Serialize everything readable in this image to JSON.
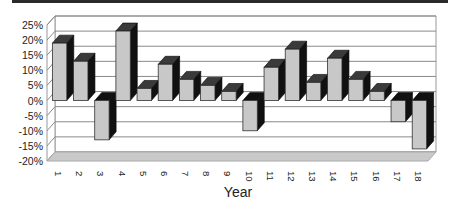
{
  "chart_data": {
    "type": "bar",
    "style": "3d-column",
    "title": "",
    "xlabel": "Year",
    "ylabel": "",
    "categories": [
      "1",
      "2",
      "3",
      "4",
      "5",
      "6",
      "7",
      "8",
      "9",
      "10",
      "11",
      "12",
      "13",
      "14",
      "15",
      "16",
      "17",
      "18"
    ],
    "values": [
      19,
      13,
      -13,
      23,
      4,
      12,
      7,
      5,
      3,
      -10,
      11,
      17,
      6,
      14,
      7,
      3,
      -7,
      -16
    ],
    "value_format": "percent",
    "y_ticks": [
      "25%",
      "20%",
      "15%",
      "10%",
      "5%",
      "0%",
      "-5%",
      "-10%",
      "-15%",
      "-20%"
    ],
    "ylim": [
      -20,
      25
    ],
    "grid": true,
    "legend": "none",
    "colors": {
      "bar_front": "#c8c8c8",
      "bar_top": "#3a3a3a",
      "bar_side": "#111111",
      "floor": "#c9c9c9",
      "wall": "#ffffff",
      "grid": "#8a8a8a"
    }
  }
}
